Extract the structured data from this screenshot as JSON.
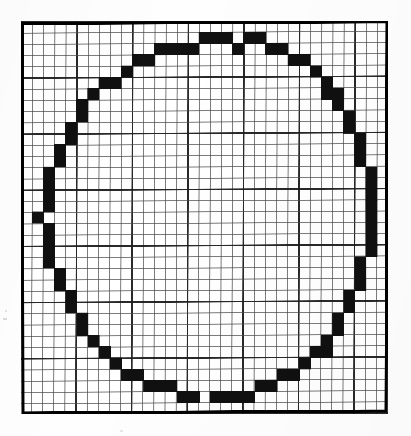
{
  "figure": {
    "name": "rasterized-circle-on-grid",
    "colors": {
      "ink": "#111111",
      "paper": "#ffffff",
      "grid_minor": "#4a4a4a",
      "grid_major": "#1e1e1e",
      "border": "#000000"
    },
    "geometry": {
      "origin_x": 21,
      "origin_y": 21,
      "width_px": 367,
      "height_px": 393,
      "cols": 33,
      "rows": 35,
      "cell_w": 11.12,
      "cell_h": 11.23,
      "major_every": 5,
      "border_width": 3,
      "grid_minor_width": 1,
      "grid_major_width": 1.6
    },
    "circle": {
      "center_col": 16.0,
      "center_row": 17.0,
      "radius_cols": 15.0,
      "stroke_cells": 1
    },
    "filled_cells": [
      [
        16,
        1
      ],
      [
        17,
        1
      ],
      [
        18,
        1
      ],
      [
        20,
        1
      ],
      [
        21,
        1
      ],
      [
        12,
        2
      ],
      [
        13,
        2
      ],
      [
        14,
        2
      ],
      [
        15,
        2
      ],
      [
        19,
        2
      ],
      [
        22,
        2
      ],
      [
        23,
        2
      ],
      [
        10,
        3
      ],
      [
        11,
        3
      ],
      [
        24,
        3
      ],
      [
        25,
        3
      ],
      [
        9,
        4
      ],
      [
        26,
        4
      ],
      [
        7,
        5
      ],
      [
        8,
        5
      ],
      [
        27,
        5
      ],
      [
        6,
        6
      ],
      [
        27,
        6
      ],
      [
        28,
        6
      ],
      [
        5,
        7
      ],
      [
        28,
        7
      ],
      [
        5,
        8
      ],
      [
        29,
        8
      ],
      [
        4,
        9
      ],
      [
        29,
        9
      ],
      [
        4,
        10
      ],
      [
        30,
        10
      ],
      [
        3,
        11
      ],
      [
        30,
        11
      ],
      [
        3,
        12
      ],
      [
        30,
        12
      ],
      [
        2,
        13
      ],
      [
        31,
        13
      ],
      [
        2,
        14
      ],
      [
        31,
        14
      ],
      [
        2,
        15
      ],
      [
        31,
        15
      ],
      [
        2,
        16
      ],
      [
        31,
        16
      ],
      [
        1,
        17
      ],
      [
        31,
        17
      ],
      [
        2,
        18
      ],
      [
        31,
        18
      ],
      [
        2,
        19
      ],
      [
        31,
        19
      ],
      [
        2,
        20
      ],
      [
        31,
        20
      ],
      [
        2,
        21
      ],
      [
        30,
        21
      ],
      [
        3,
        22
      ],
      [
        30,
        22
      ],
      [
        3,
        23
      ],
      [
        30,
        23
      ],
      [
        4,
        24
      ],
      [
        29,
        24
      ],
      [
        4,
        25
      ],
      [
        29,
        25
      ],
      [
        5,
        26
      ],
      [
        28,
        26
      ],
      [
        5,
        27
      ],
      [
        28,
        27
      ],
      [
        6,
        28
      ],
      [
        27,
        28
      ],
      [
        7,
        29
      ],
      [
        26,
        29
      ],
      [
        27,
        29
      ],
      [
        8,
        30
      ],
      [
        25,
        30
      ],
      [
        9,
        31
      ],
      [
        10,
        31
      ],
      [
        23,
        31
      ],
      [
        24,
        31
      ],
      [
        11,
        32
      ],
      [
        12,
        32
      ],
      [
        13,
        32
      ],
      [
        21,
        32
      ],
      [
        22,
        32
      ],
      [
        14,
        33
      ],
      [
        15,
        33
      ],
      [
        17,
        33
      ],
      [
        18,
        33
      ],
      [
        19,
        33
      ],
      [
        20,
        33
      ]
    ]
  }
}
